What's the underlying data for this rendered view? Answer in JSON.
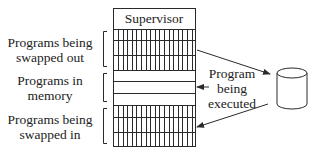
{
  "diagram": {
    "memory_column": {
      "supervisor_label": "Supervisor",
      "sections": [
        {
          "id": "swapped-out",
          "style": "hatched",
          "rows": 3
        },
        {
          "id": "in-memory",
          "style": "plain",
          "rows": 3
        },
        {
          "id": "swapped-in",
          "style": "hatched",
          "rows": 3
        }
      ]
    },
    "left_labels": {
      "swapped_out_line1": "Programs being",
      "swapped_out_line2": "swapped out",
      "in_memory_line1": "Programs in",
      "in_memory_line2": "memory",
      "swapped_in_line1": "Programs being",
      "swapped_in_line2": "swapped in"
    },
    "right_label": {
      "line1": "Program",
      "line2": "being",
      "line3": "executed"
    },
    "disk": {
      "icon": "disk-cylinder-icon"
    },
    "arrows": [
      {
        "from": "swapped-out",
        "to": "disk"
      },
      {
        "from": "disk",
        "to": "swapped-in"
      },
      {
        "from": "program-being-executed-label",
        "to": "in-memory"
      }
    ],
    "colors": {
      "line": "#2a2a2a",
      "background": "#ffffff"
    }
  }
}
